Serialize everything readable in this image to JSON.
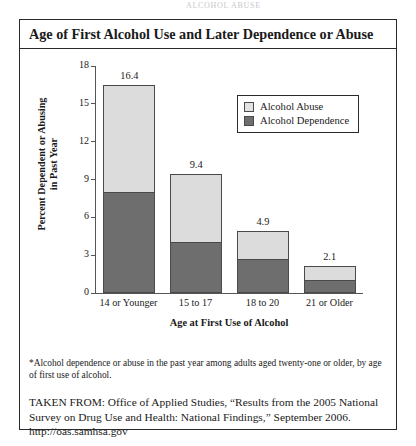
{
  "running_header": "ALCOHOL ABUSE",
  "figure": {
    "title": "Age of First Alcohol Use and Later Dependence or Abuse",
    "footnote": "*Alcohol dependence or abuse in the past year among adults aged twenty-one or older, by age of first use of alcohol.",
    "source": "TAKEN FROM: Office of Applied Studies, “Results from the 2005 National Survey on Drug Use and Health: National Findings,” September 2006. http://oas.samhsa.gov"
  },
  "colors": {
    "abuse": "#dcdcdc",
    "dependence": "#6e6e6e",
    "frame": "#2a2a2a",
    "axis": "#555555"
  },
  "chart_data": {
    "type": "bar",
    "stacked": true,
    "title": "Age of First Alcohol Use and Later Dependence or Abuse",
    "xlabel": "Age at First Use of Alcohol",
    "ylabel": "Percent Dependent or Abusing\nin Past Year",
    "categories": [
      "14 or Younger",
      "15 to 17",
      "18 to 20",
      "21 or Older"
    ],
    "series": [
      {
        "name": "Alcohol Dependence",
        "values": [
          8.0,
          4.0,
          2.7,
          1.0
        ]
      },
      {
        "name": "Alcohol Abuse",
        "values": [
          8.4,
          5.4,
          2.2,
          1.1
        ]
      }
    ],
    "totals": [
      16.4,
      9.4,
      4.9,
      2.1
    ],
    "total_labels": [
      "16.4",
      "9.4",
      "4.9",
      "2.1"
    ],
    "yticks": [
      0,
      3,
      6,
      9,
      12,
      15,
      18
    ],
    "ytick_labels": [
      "0",
      "3",
      "6",
      "9",
      "12",
      "15",
      "18"
    ],
    "ylim": [
      0,
      18
    ],
    "grid": false,
    "legend_position": "top-right",
    "legend": [
      "Alcohol Abuse",
      "Alcohol Dependence"
    ]
  }
}
